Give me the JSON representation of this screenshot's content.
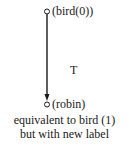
{
  "diagram": {
    "nodes": [
      {
        "id": "top",
        "label": "(bird(0))",
        "shape": "open-circle"
      },
      {
        "id": "bottom",
        "label": "(robin)",
        "shape": "open-circle"
      }
    ],
    "edges": [
      {
        "from": "top",
        "to": "bottom",
        "label": "T",
        "directed": true
      }
    ],
    "caption": {
      "line1": "equivalent to bird (1)",
      "line2": "but with new label"
    },
    "colors": {
      "stroke": "#1a1a1a",
      "background": "#ffffff"
    }
  }
}
